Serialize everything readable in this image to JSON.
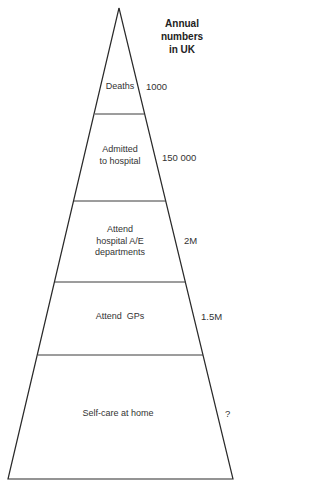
{
  "heading": {
    "lines": [
      "Annual",
      "numbers",
      "in UK"
    ]
  },
  "pyramid": {
    "apex": {
      "x": 119,
      "y": 8
    },
    "base": {
      "y": 479,
      "left_x": 8,
      "right_x": 233
    },
    "line_color": "#2a2a2a",
    "dividers": [
      {
        "y": 114,
        "x1": 95,
        "x2": 144
      },
      {
        "y": 201,
        "x1": 74,
        "x2": 166
      },
      {
        "y": 282,
        "x1": 55,
        "x2": 186
      },
      {
        "y": 355,
        "x1": 38,
        "x2": 203
      }
    ]
  },
  "tiers": [
    {
      "label_lines": [
        "Deaths"
      ],
      "value": "1000"
    },
    {
      "label_lines": [
        "Admitted",
        "to hospital"
      ],
      "value": "150 000"
    },
    {
      "label_lines": [
        "Attend",
        "hospital A/E",
        "departments"
      ],
      "value": "2M"
    },
    {
      "label_lines": [
        "Attend  GPs"
      ],
      "value": "1.5M"
    },
    {
      "label_lines": [
        "Self-care at home"
      ],
      "value": "?"
    }
  ]
}
